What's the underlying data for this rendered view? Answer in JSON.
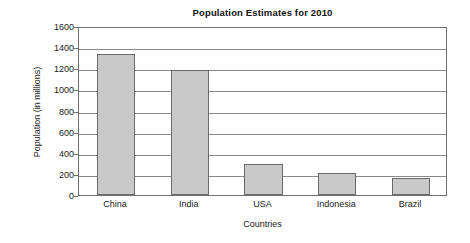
{
  "chart_data": {
    "type": "bar",
    "title": "Population Estimates for 2010",
    "xlabel": "Countries",
    "ylabel": "Population (in millions)",
    "categories": [
      "China",
      "India",
      "USA",
      "Indonesia",
      "Brazil"
    ],
    "values": [
      1335,
      1180,
      295,
      212,
      160
    ],
    "ylim": [
      0,
      1600
    ],
    "ytick_step": 200,
    "yticks": [
      0,
      200,
      400,
      600,
      800,
      1000,
      1200,
      1400,
      1600
    ],
    "ytick_labels": [
      "0",
      "200",
      "400",
      "600",
      "800",
      "1000",
      "1200",
      "1400",
      "1600"
    ],
    "grid": true,
    "grid_axis": "y",
    "legend": false,
    "legend_position": "none",
    "bar_fill_color": "#c9c9c9",
    "bar_border_color": "#6b6b6b",
    "gridline_color": "#8a8a8a",
    "axis_color": "#6f6f6f",
    "background_color": "#ffffff",
    "series": [
      {
        "name": "Population",
        "values": [
          1335,
          1180,
          295,
          212,
          160
        ]
      }
    ]
  }
}
